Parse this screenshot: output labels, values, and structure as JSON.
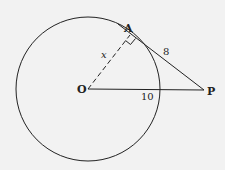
{
  "diagram": {
    "type": "geometry",
    "colors": {
      "background": "#f2f2f2",
      "stroke": "#222222"
    },
    "points": {
      "O": {
        "label": "O",
        "x": 88,
        "y": 89
      },
      "A": {
        "label": "A",
        "x": 130,
        "y": 35
      },
      "P": {
        "label": "P",
        "x": 204,
        "y": 90
      }
    },
    "circle": {
      "center": "O",
      "radius": 72
    },
    "segments": [
      {
        "from": "O",
        "to": "A",
        "style": "dashed",
        "label": "x"
      },
      {
        "from": "A",
        "to": "P",
        "style": "solid",
        "label": "8"
      },
      {
        "from": "O",
        "to": "P",
        "style": "solid",
        "label": "10"
      }
    ],
    "right_angle_at": "A"
  },
  "labels": {
    "A": "A",
    "O": "O",
    "P": "P",
    "OA": "x",
    "AP": "8",
    "OP": "10"
  }
}
